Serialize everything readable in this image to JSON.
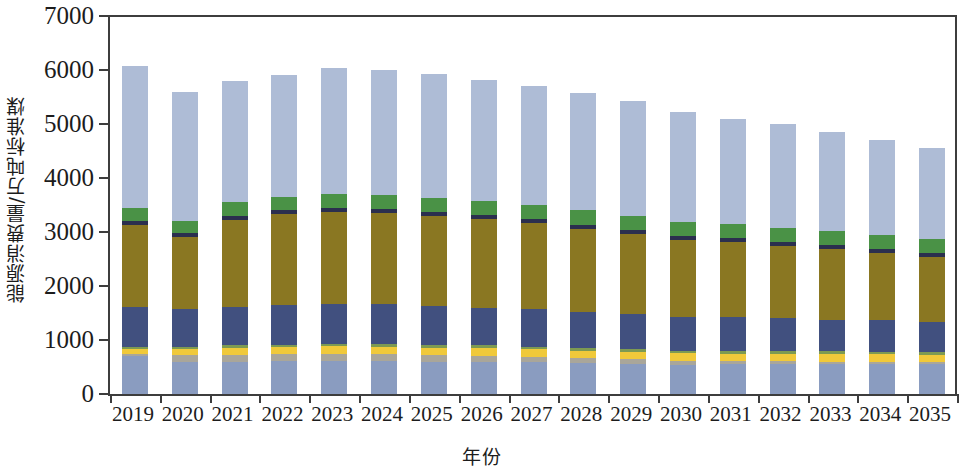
{
  "chart_data": {
    "type": "bar",
    "stacked": true,
    "title": "",
    "subtitle": "",
    "xlabel": "年份",
    "ylabel": "能源消费量/万吨标准煤",
    "grid": false,
    "legend_position": "none",
    "ylim": [
      0,
      7000
    ],
    "ytick_labels": [
      "0",
      "1000",
      "2000",
      "3000",
      "4000",
      "5000",
      "6000",
      "7000"
    ],
    "yticks": [
      0,
      1000,
      2000,
      3000,
      4000,
      5000,
      6000,
      7000
    ],
    "categories": [
      "2019",
      "2020",
      "2021",
      "2022",
      "2023",
      "2024",
      "2025",
      "2026",
      "2027",
      "2028",
      "2029",
      "2030",
      "2031",
      "2032",
      "2033",
      "2034",
      "2035"
    ],
    "totals": [
      6080,
      5590,
      5800,
      5910,
      6030,
      6000,
      5920,
      5810,
      5710,
      5570,
      5410,
      5220,
      5100,
      5000,
      4850,
      4710,
      4560
    ],
    "series": [
      {
        "name": "series-1-base",
        "color": "#8a9cc0",
        "values": [
          700,
          590,
          600,
          610,
          620,
          610,
          600,
          600,
          590,
          570,
          550,
          530,
          550,
          550,
          550,
          550,
          550
        ]
      },
      {
        "name": "series-2-gray",
        "color": "#a9a69a",
        "values": [
          45,
          130,
          130,
          130,
          130,
          130,
          120,
          110,
          100,
          95,
          90,
          85,
          60,
          55,
          50,
          45,
          40
        ]
      },
      {
        "name": "series-3-yellow",
        "color": "#f0c93a",
        "values": [
          80,
          120,
          125,
          130,
          135,
          140,
          140,
          140,
          140,
          140,
          140,
          140,
          140,
          140,
          140,
          140,
          140
        ]
      },
      {
        "name": "series-4-green-thin",
        "color": "#7d9a52",
        "values": [
          40,
          40,
          45,
          45,
          50,
          50,
          50,
          50,
          50,
          50,
          50,
          50,
          50,
          50,
          50,
          50,
          50
        ]
      },
      {
        "name": "series-5-navy",
        "color": "#41507f",
        "values": [
          740,
          700,
          720,
          730,
          740,
          730,
          720,
          700,
          690,
          670,
          650,
          630,
          620,
          610,
          590,
          580,
          560
        ]
      },
      {
        "name": "series-6-olive",
        "color": "#8a7722",
        "values": [
          1530,
          1330,
          1610,
          1680,
          1700,
          1690,
          1670,
          1640,
          1600,
          1540,
          1490,
          1420,
          1390,
          1340,
          1300,
          1240,
          1200
        ]
      },
      {
        "name": "series-7-navy-thin",
        "color": "#2b2f4e",
        "values": [
          70,
          70,
          75,
          75,
          75,
          75,
          75,
          75,
          75,
          75,
          75,
          75,
          75,
          75,
          75,
          75,
          75
        ]
      },
      {
        "name": "series-8-green",
        "color": "#4a9246",
        "values": [
          240,
          230,
          250,
          255,
          260,
          260,
          260,
          260,
          260,
          260,
          260,
          260,
          260,
          260,
          260,
          260,
          260
        ]
      },
      {
        "name": "series-9-top",
        "color": "#aebcd6",
        "values": [
          2635,
          2380,
          2245,
          2255,
          2320,
          2315,
          2285,
          2235,
          2205,
          2170,
          2115,
          2030,
          1955,
          1920,
          1835,
          1770,
          1685
        ]
      }
    ]
  },
  "axis": {
    "y_title": "能源消费量/万吨标准煤",
    "x_title": "年份"
  }
}
